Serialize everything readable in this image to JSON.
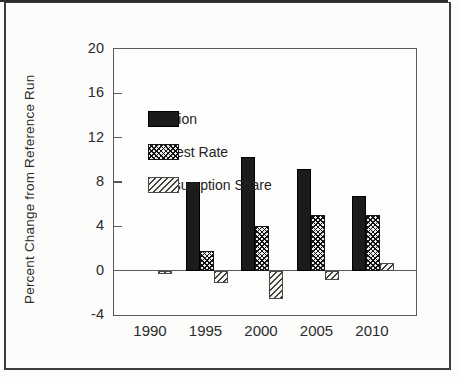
{
  "figure": {
    "ylabel": "Percent Change from Reference Run"
  },
  "chart_data": {
    "type": "bar",
    "title": "",
    "xlabel": "",
    "ylabel": "Percent Change from Reference Run",
    "categories": [
      "1990",
      "1995",
      "2000",
      "2005",
      "2010"
    ],
    "series": [
      {
        "name": "Inflation",
        "pattern": "solid",
        "values": [
          0,
          8.0,
          10.3,
          9.2,
          6.7
        ]
      },
      {
        "name": "Interest Rate",
        "pattern": "crosshatch",
        "values": [
          0,
          1.8,
          4.0,
          5.0,
          5.0
        ]
      },
      {
        "name": "Consumption Share",
        "pattern": "diagonal",
        "values": [
          -0.3,
          -1.1,
          -2.6,
          -0.8,
          0.7
        ]
      }
    ],
    "ylim": [
      -4,
      20
    ],
    "yticks": [
      20,
      16,
      12,
      8,
      4,
      0,
      -4
    ],
    "grid": false,
    "zero_line": true,
    "legend_position": "top-left-inside"
  },
  "colors": {
    "bar_solid": "#1b1b1b",
    "frame": "#5a5a5a",
    "outer_border": "#3c3c3c",
    "background": "#fcfcfb"
  }
}
